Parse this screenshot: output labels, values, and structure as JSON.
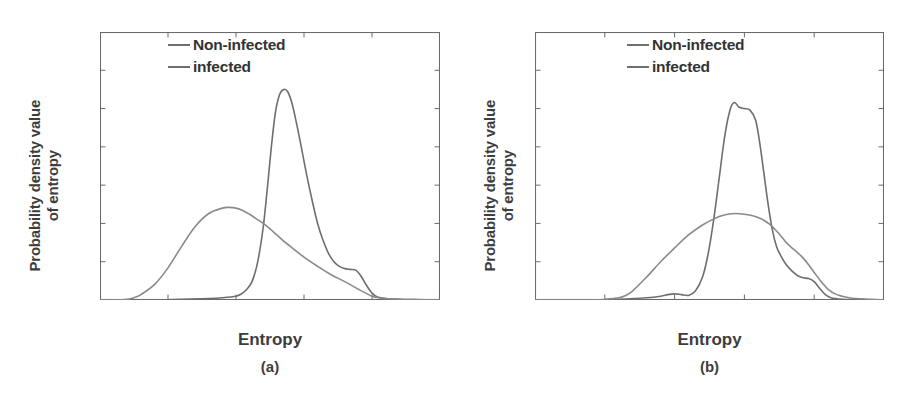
{
  "figure": {
    "panels": [
      {
        "id": "a",
        "caption": "(a)",
        "xlabel": "Entropy",
        "ylabel": "Probability density value\nof entropy",
        "legend": [
          {
            "label": "Non-infected",
            "color": "#6e6e6e"
          },
          {
            "label": "infected",
            "color": "#8a8a8a"
          }
        ]
      },
      {
        "id": "b",
        "caption": "(b)",
        "xlabel": "Entropy",
        "ylabel": "Probability density value\nof entropy",
        "legend": [
          {
            "label": "Non-infected",
            "color": "#6e6e6e"
          },
          {
            "label": "infected",
            "color": "#8a8a8a"
          }
        ]
      }
    ]
  },
  "chart_data": [
    {
      "type": "line",
      "panel": "a",
      "title": "(a)",
      "xlabel": "Entropy",
      "ylabel": "Probability density value of entropy",
      "xlim": [
        0,
        25
      ],
      "ylim": [
        0,
        0.35
      ],
      "xticks": [
        0,
        5,
        10,
        15,
        20,
        25
      ],
      "xticklabels": [
        "0",
        "5",
        "10",
        "15",
        "20",
        "25"
      ],
      "yticks": [
        0,
        0.05,
        0.1,
        0.15,
        0.2,
        0.25,
        0.3,
        0.35
      ],
      "yticklabels": [
        "0",
        "0.05",
        "0.1",
        "0.15",
        "0.2",
        "0.25",
        "0.3",
        "0.35"
      ],
      "grid": false,
      "legend_position": "top-right",
      "series": [
        {
          "name": "Non-infected",
          "color": "#6e6e6e",
          "x": [
            0,
            2,
            4,
            6,
            8,
            9,
            10,
            10.4,
            10.8,
            11.2,
            11.6,
            12,
            12.3,
            12.6,
            12.9,
            13.2,
            13.5,
            13.8,
            14.1,
            14.4,
            14.8,
            15.2,
            15.6,
            16,
            16.4,
            16.8,
            17.2,
            17.6,
            18,
            18.4,
            18.8,
            19.2,
            19.6,
            20,
            20.4,
            21,
            22,
            23,
            25
          ],
          "y": [
            0,
            0,
            0,
            0.001,
            0.002,
            0.003,
            0.005,
            0.008,
            0.014,
            0.025,
            0.05,
            0.095,
            0.145,
            0.2,
            0.245,
            0.268,
            0.275,
            0.272,
            0.258,
            0.235,
            0.2,
            0.163,
            0.13,
            0.1,
            0.078,
            0.061,
            0.05,
            0.044,
            0.041,
            0.04,
            0.039,
            0.031,
            0.019,
            0.009,
            0.004,
            0.002,
            0.001,
            0.0005,
            0
          ]
        },
        {
          "name": "infected",
          "color": "#8a8a8a",
          "x": [
            0,
            1,
            2,
            2.5,
            3,
            4,
            5,
            6,
            7,
            8,
            9,
            9.5,
            10,
            10.5,
            11,
            11.5,
            12,
            12.5,
            13,
            13.5,
            14,
            15,
            16,
            17,
            18,
            19,
            20,
            20.5,
            21,
            22,
            23,
            25
          ],
          "y": [
            0,
            0,
            0.001,
            0.003,
            0.007,
            0.02,
            0.042,
            0.07,
            0.096,
            0.113,
            0.12,
            0.121,
            0.12,
            0.117,
            0.112,
            0.106,
            0.1,
            0.093,
            0.085,
            0.077,
            0.07,
            0.056,
            0.044,
            0.033,
            0.024,
            0.014,
            0.005,
            0.003,
            0.002,
            0.001,
            0.0005,
            0
          ]
        }
      ]
    },
    {
      "type": "line",
      "panel": "b",
      "title": "(b)",
      "xlabel": "Entropy",
      "ylabel": "Probability density value of entropy",
      "xlim": [
        0,
        25
      ],
      "ylim": [
        0,
        0.35
      ],
      "xticks": [
        0,
        5,
        10,
        15,
        20,
        25
      ],
      "xticklabels": [
        "0",
        "5",
        "10",
        "15",
        "20",
        "25"
      ],
      "yticks": [
        0,
        0.05,
        0.1,
        0.15,
        0.2,
        0.25,
        0.3,
        0.35
      ],
      "yticklabels": [
        "0",
        "0.05",
        "0.1",
        "0.15",
        "0.2",
        "0.25",
        "0.3",
        "0.35"
      ],
      "grid": false,
      "legend_position": "top-right",
      "series": [
        {
          "name": "Non-infected",
          "color": "#6e6e6e",
          "x": [
            0,
            4,
            6,
            8,
            9,
            9.5,
            10,
            10.5,
            11,
            11.5,
            12,
            12.4,
            12.8,
            13.2,
            13.6,
            14,
            14.3,
            14.6,
            15,
            15.4,
            15.8,
            16.1,
            16.4,
            16.7,
            17,
            17.3,
            17.6,
            18,
            18.4,
            18.8,
            19.2,
            19.6,
            20,
            20.4,
            20.8,
            21.2,
            22,
            23,
            25
          ],
          "y": [
            0,
            0,
            0.001,
            0.003,
            0.005,
            0.007,
            0.008,
            0.007,
            0.006,
            0.012,
            0.03,
            0.06,
            0.105,
            0.16,
            0.215,
            0.25,
            0.258,
            0.252,
            0.25,
            0.248,
            0.235,
            0.205,
            0.165,
            0.125,
            0.092,
            0.07,
            0.058,
            0.046,
            0.038,
            0.032,
            0.029,
            0.028,
            0.024,
            0.015,
            0.007,
            0.003,
            0.001,
            0.0005,
            0
          ]
        },
        {
          "name": "infected",
          "color": "#8a8a8a",
          "x": [
            0,
            4,
            5,
            6,
            6.5,
            7,
            8,
            9,
            10,
            11,
            12,
            12.6,
            13.2,
            13.8,
            14.4,
            15,
            15.6,
            16.2,
            16.8,
            17.2,
            17.6,
            18,
            18.4,
            18.8,
            19.2,
            19.6,
            20,
            20.5,
            21,
            21.5,
            22,
            22.5,
            23,
            24,
            25
          ],
          "y": [
            0,
            0,
            0.001,
            0.003,
            0.006,
            0.012,
            0.03,
            0.05,
            0.068,
            0.085,
            0.098,
            0.104,
            0.109,
            0.112,
            0.113,
            0.112,
            0.11,
            0.106,
            0.099,
            0.092,
            0.084,
            0.075,
            0.068,
            0.062,
            0.055,
            0.046,
            0.036,
            0.024,
            0.014,
            0.008,
            0.005,
            0.003,
            0.002,
            0.001,
            0
          ]
        }
      ]
    }
  ]
}
